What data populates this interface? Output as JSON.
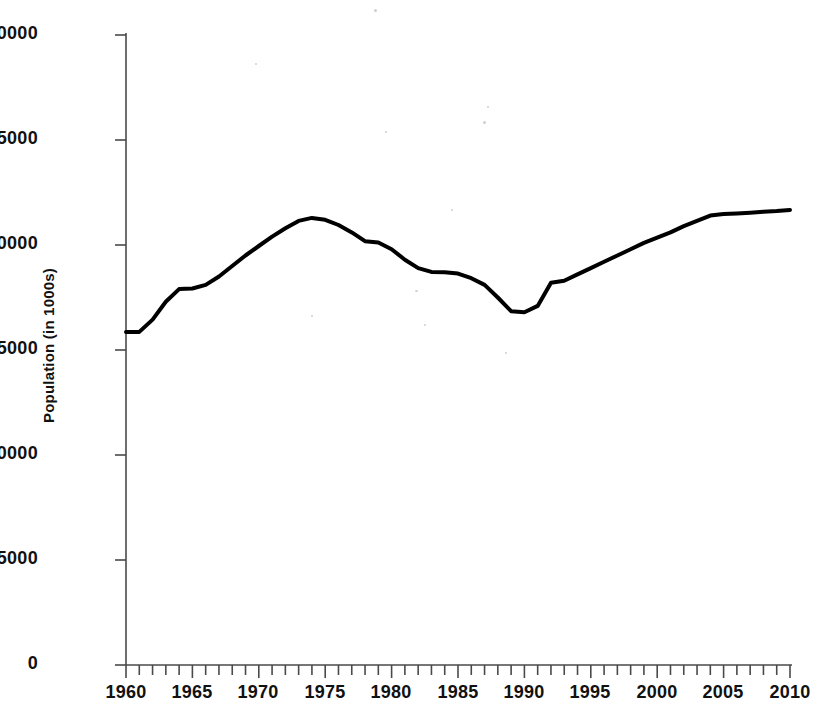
{
  "chart_data": {
    "type": "line",
    "title": "",
    "xlabel": "",
    "ylabel": "Population (in 1000s)",
    "xlim": [
      1960,
      2010
    ],
    "ylim": [
      0,
      30000
    ],
    "grid": false,
    "legend": null,
    "xticks": [
      1960,
      1965,
      1970,
      1975,
      1980,
      1985,
      1990,
      1995,
      2000,
      2005,
      2010
    ],
    "xtick_labels": [
      "1960",
      "1965",
      "1970",
      "1975",
      "1980",
      "1985",
      "1990",
      "1995",
      "2000",
      "2005",
      "2010"
    ],
    "xminor_tick_step": 1,
    "yticks": [
      0,
      5000,
      10000,
      15000,
      20000,
      25000,
      30000
    ],
    "ytick_labels": [
      "0",
      "5000",
      "10000",
      "15000",
      "20000",
      "25000",
      "30000"
    ],
    "series": [
      {
        "name": "Population",
        "color": "#000000",
        "linewidth": 4,
        "x": [
          1960,
          1961,
          1962,
          1963,
          1964,
          1965,
          1966,
          1967,
          1968,
          1969,
          1970,
          1971,
          1972,
          1973,
          1974,
          1975,
          1976,
          1977,
          1978,
          1979,
          1980,
          1981,
          1982,
          1983,
          1984,
          1985,
          1986,
          1987,
          1988,
          1989,
          1990,
          1991,
          1992,
          1993,
          1994,
          1995,
          1996,
          1997,
          1998,
          1999,
          2000,
          2001,
          2002,
          2003,
          2004,
          2005,
          2006,
          2007,
          2008,
          2009,
          2010
        ],
        "y": [
          15860,
          15860,
          16450,
          17300,
          17900,
          17930,
          18100,
          18500,
          19000,
          19500,
          19950,
          20400,
          20800,
          21150,
          21290,
          21200,
          20950,
          20600,
          20180,
          20120,
          19800,
          19300,
          18900,
          18720,
          18700,
          18640,
          18420,
          18100,
          17500,
          16850,
          16800,
          17100,
          18200,
          18300,
          18600,
          18900,
          19200,
          19500,
          19800,
          20100,
          20350,
          20600,
          20900,
          21150,
          21400,
          21470,
          21500,
          21540,
          21580,
          21620,
          21670
        ]
      }
    ]
  },
  "axes": {
    "y_axis_name": "y-axis",
    "x_axis_name": "x-axis"
  }
}
